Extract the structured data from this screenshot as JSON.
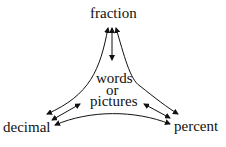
{
  "diagram": {
    "nodes": {
      "top": "fraction",
      "center_line1": "words",
      "center_line2": "or",
      "center_line3": "pictures",
      "left": "decimal",
      "right": "percent"
    },
    "edges": [
      {
        "from": "fraction",
        "to": "decimal",
        "type": "bidirectional"
      },
      {
        "from": "fraction",
        "to": "percent",
        "type": "bidirectional"
      },
      {
        "from": "decimal",
        "to": "percent",
        "type": "bidirectional"
      },
      {
        "from": "fraction",
        "to": "words or pictures",
        "type": "bidirectional"
      },
      {
        "from": "decimal",
        "to": "words or pictures",
        "type": "bidirectional"
      },
      {
        "from": "percent",
        "to": "words or pictures",
        "type": "bidirectional"
      }
    ]
  }
}
